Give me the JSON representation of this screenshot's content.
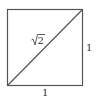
{
  "diagram": {
    "shape": "unit square with diagonal",
    "diagonal_label": "√2",
    "radicand": "2",
    "side_label_right": "1",
    "side_label_bottom": "1",
    "stroke_color": "#555555"
  }
}
